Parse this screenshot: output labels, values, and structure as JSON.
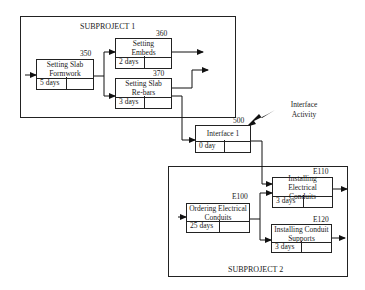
{
  "subproject1": {
    "label": "SUBPROJECT 1",
    "activities": [
      {
        "id": "350",
        "title": "Setting Slab Formwork",
        "duration": "5 days"
      },
      {
        "id": "360",
        "title": "Setting Embeds",
        "duration": "2 days"
      },
      {
        "id": "370",
        "title": "Setting Slab Re-bars",
        "duration": "3 days"
      }
    ]
  },
  "interface": {
    "id": "500",
    "title": "Interface 1",
    "duration": "0 day",
    "callout": "Interface Activity"
  },
  "subproject2": {
    "label": "SUBPROJECT 2",
    "activities": [
      {
        "id": "E100",
        "title": "Ordering Electrical Conduits",
        "duration": "25 days"
      },
      {
        "id": "E110",
        "title": "Installing Electrical Conduits",
        "duration": "3 days"
      },
      {
        "id": "E120",
        "title": "Installing Conduit Supports",
        "duration": "3 days"
      }
    ]
  }
}
